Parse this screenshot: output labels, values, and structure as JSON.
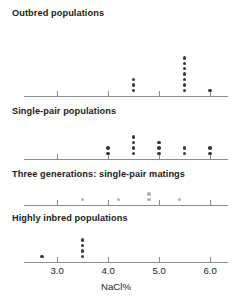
{
  "figure": {
    "axis_title": "NaCl%",
    "x_ticks": [
      {
        "value": 3.0,
        "label": "3.0"
      },
      {
        "value": 4.0,
        "label": "4.0"
      },
      {
        "value": 5.0,
        "label": "5.0"
      },
      {
        "value": 6.0,
        "label": "6.0"
      }
    ],
    "dot_color": "#3a3a3a",
    "dot_color_light": "#b3b3b3",
    "axis_color": "#8d8d8d"
  },
  "chart_data": {
    "type": "scatter",
    "title": "",
    "xlabel": "NaCl%",
    "ylabel": "",
    "xlim": [
      2.35,
      6.35
    ],
    "grid": false,
    "legend": "none",
    "tick_labels": [
      "3.0",
      "4.0",
      "5.0",
      "6.0"
    ],
    "tick_values": [
      3.0,
      4.0,
      5.0,
      6.0
    ],
    "panels": [
      {
        "name": "outbred-populations",
        "label": "Outbred populations",
        "dot_shade": "dark",
        "stacks": [
          {
            "x": 4.5,
            "count": 3
          },
          {
            "x": 5.5,
            "count": 7
          },
          {
            "x": 6.0,
            "count": 1
          }
        ],
        "values": [
          4.5,
          4.5,
          4.5,
          5.5,
          5.5,
          5.5,
          5.5,
          5.5,
          5.5,
          5.5,
          6.0
        ]
      },
      {
        "name": "single-pair-populations",
        "label": "Single-pair populations",
        "dot_shade": "dark",
        "stacks": [
          {
            "x": 4.0,
            "count": 2
          },
          {
            "x": 4.5,
            "count": 4
          },
          {
            "x": 5.0,
            "count": 3
          },
          {
            "x": 5.5,
            "count": 2
          },
          {
            "x": 6.0,
            "count": 2
          }
        ],
        "values": [
          4.0,
          4.0,
          4.5,
          4.5,
          4.5,
          4.5,
          5.0,
          5.0,
          5.0,
          5.5,
          5.5,
          6.0,
          6.0
        ]
      },
      {
        "name": "three-generations-single-pair-matings",
        "label": "Three generations: single-pair matings",
        "dot_shade": "light",
        "stacks": [
          {
            "x": 3.5,
            "count": 1
          },
          {
            "x": 4.2,
            "count": 1
          },
          {
            "x": 4.8,
            "count": 2
          },
          {
            "x": 5.4,
            "count": 1
          }
        ],
        "values": [
          3.5,
          4.2,
          4.8,
          4.8,
          5.4
        ]
      },
      {
        "name": "highly-inbred-populations",
        "label": "Highly inbred populations",
        "dot_shade": "dark",
        "stacks": [
          {
            "x": 2.7,
            "count": 1
          },
          {
            "x": 3.5,
            "count": 4
          }
        ],
        "values": [
          2.7,
          3.5,
          3.5,
          3.5,
          3.5
        ]
      }
    ]
  }
}
